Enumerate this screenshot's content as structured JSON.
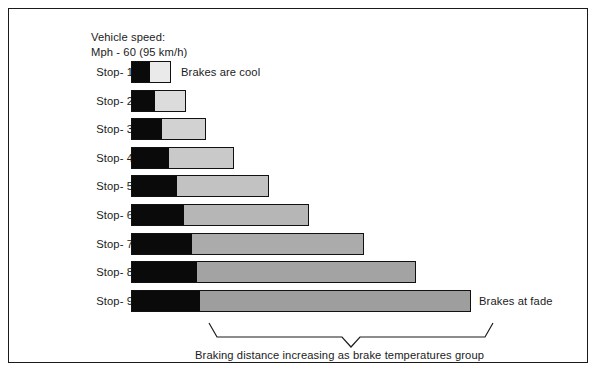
{
  "frame": {
    "border_color": "#1a1a1a"
  },
  "header": {
    "line1": "Vehicle speed:",
    "line2": "Mph - 60 (95 km/h)"
  },
  "annotations": {
    "first_stop_note": "Brakes are cool",
    "last_stop_note": "Brakes at fade",
    "bracket_caption": "Braking distance increasing as brake temperatures group"
  },
  "chart_data": {
    "type": "bar",
    "orientation": "horizontal",
    "title": "Vehicle speed: Mph - 60 (95 km/h)",
    "xlabel": "Braking distance increasing as brake temperatures group",
    "ylabel": "",
    "grid": false,
    "legend_position": "none",
    "stacked": true,
    "categories": [
      "Stop- 1",
      "Stop- 2",
      "Stop- 3",
      "Stop- 4",
      "Stop- 5",
      "Stop- 6",
      "Stop- 7",
      "Stop- 8",
      "Stop- 9"
    ],
    "series": [
      {
        "name": "Initial reaction / threshold (black)",
        "color": "#0a0a0a",
        "values": [
          18,
          23,
          30,
          37,
          45,
          52,
          60,
          65,
          68
        ]
      },
      {
        "name": "Braking distance (gray)",
        "values": [
          22,
          32,
          45,
          66,
          93,
          126,
          173,
          220,
          272
        ],
        "colors": [
          "#eaeaea",
          "#dcdcdc",
          "#d2d2d2",
          "#c9c9c9",
          "#c2c2c2",
          "#b6b6b6",
          "#ababab",
          "#a3a3a3",
          "#9e9e9e"
        ]
      }
    ],
    "totals": [
      40,
      55,
      75,
      103,
      138,
      178,
      233,
      285,
      340
    ],
    "xlim": [
      0,
      340
    ],
    "bars": [
      {
        "label": "Stop- 1",
        "black_width": 18,
        "gray_width": 22,
        "total": 40,
        "gray_color": "#eaeaea",
        "note": "Brakes are cool"
      },
      {
        "label": "Stop- 2",
        "black_width": 23,
        "gray_width": 32,
        "total": 55,
        "gray_color": "#dcdcdc",
        "note": ""
      },
      {
        "label": "Stop- 3",
        "black_width": 30,
        "gray_width": 45,
        "total": 75,
        "gray_color": "#d2d2d2",
        "note": ""
      },
      {
        "label": "Stop- 4",
        "black_width": 37,
        "gray_width": 66,
        "total": 103,
        "gray_color": "#c9c9c9",
        "note": ""
      },
      {
        "label": "Stop- 5",
        "black_width": 45,
        "gray_width": 93,
        "total": 138,
        "gray_color": "#c2c2c2",
        "note": ""
      },
      {
        "label": "Stop- 6",
        "black_width": 52,
        "gray_width": 126,
        "total": 178,
        "gray_color": "#b6b6b6",
        "note": ""
      },
      {
        "label": "Stop- 7",
        "black_width": 60,
        "gray_width": 173,
        "total": 233,
        "gray_color": "#ababab",
        "note": ""
      },
      {
        "label": "Stop- 8",
        "black_width": 65,
        "gray_width": 220,
        "total": 285,
        "gray_color": "#a3a3a3",
        "note": ""
      },
      {
        "label": "Stop- 9",
        "black_width": 68,
        "gray_width": 272,
        "total": 340,
        "gray_color": "#9e9e9e",
        "note": "Brakes at fade"
      }
    ]
  }
}
